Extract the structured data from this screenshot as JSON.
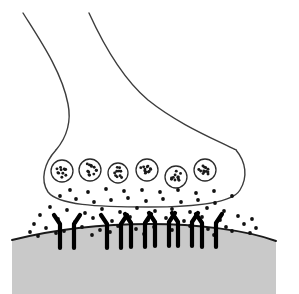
{
  "figure": {
    "width": 299,
    "height": 294,
    "background_color": "#ffffff"
  },
  "style": {
    "outline_color": "#3c3c3c",
    "outline_width": 1.4,
    "vesicle_stroke": "#2b2b2b",
    "vesicle_stroke_width": 1.3,
    "vesicle_fill": "#ffffff",
    "granule_color": "#1a1a1a",
    "receptor_color": "#000000",
    "receptor_width": 4.2,
    "membrane_fill": "#c9c9c9",
    "membrane_stroke": "#1a1a1a",
    "membrane_stroke_width": 2.0,
    "neurotransmitter_color": "#111111",
    "neurotransmitter_radius": 1.9
  },
  "axon": {
    "label": "axon",
    "left_branch_path": "M 23,13 C 40,40 62,72 68,104 C 72,124 66,138 56,150",
    "right_branch_path": "M 89,13 C 104,46 122,78 148,100 C 178,124 212,138 236,150"
  },
  "terminal": {
    "label": "axon-terminal-bouton",
    "outline_path": "M 56,150 C 44,163 40,180 48,192 C 58,205 96,207 148,207 C 198,207 232,203 240,190 C 248,177 246,162 236,150",
    "fill": "#ffffff"
  },
  "vesicles": {
    "label": "synaptic-vesicles",
    "count": 6,
    "items": [
      {
        "id": "vesicle-1",
        "cx": 62,
        "cy": 171,
        "r": 11,
        "granules": 11
      },
      {
        "id": "vesicle-2",
        "cx": 90,
        "cy": 170,
        "r": 11,
        "granules": 12
      },
      {
        "id": "vesicle-3",
        "cx": 118,
        "cy": 173,
        "r": 10,
        "granules": 10
      },
      {
        "id": "vesicle-4",
        "cx": 147,
        "cy": 170,
        "r": 11,
        "granules": 12
      },
      {
        "id": "vesicle-5",
        "cx": 176,
        "cy": 177,
        "r": 11,
        "granules": 11
      },
      {
        "id": "vesicle-6",
        "cx": 205,
        "cy": 170,
        "r": 11,
        "granules": 12
      }
    ]
  },
  "cleft": {
    "label": "synaptic-cleft",
    "neurotransmitter_dots": [
      [
        60,
        196
      ],
      [
        76,
        199
      ],
      [
        94,
        202
      ],
      [
        111,
        200
      ],
      [
        128,
        198
      ],
      [
        146,
        201
      ],
      [
        163,
        199
      ],
      [
        181,
        202
      ],
      [
        198,
        200
      ],
      [
        215,
        203
      ],
      [
        50,
        207
      ],
      [
        67,
        210
      ],
      [
        85,
        213
      ],
      [
        102,
        209
      ],
      [
        120,
        212
      ],
      [
        137,
        208
      ],
      [
        155,
        211
      ],
      [
        172,
        209
      ],
      [
        190,
        212
      ],
      [
        207,
        208
      ],
      [
        224,
        211
      ],
      [
        40,
        215
      ],
      [
        58,
        219
      ],
      [
        75,
        222
      ],
      [
        93,
        218
      ],
      [
        112,
        221
      ],
      [
        130,
        217
      ],
      [
        148,
        220
      ],
      [
        166,
        218
      ],
      [
        184,
        221
      ],
      [
        202,
        217
      ],
      [
        220,
        220
      ],
      [
        238,
        216
      ],
      [
        46,
        228
      ],
      [
        64,
        231
      ],
      [
        82,
        227
      ],
      [
        100,
        230
      ],
      [
        118,
        226
      ],
      [
        136,
        229
      ],
      [
        154,
        227
      ],
      [
        172,
        230
      ],
      [
        190,
        226
      ],
      [
        208,
        229
      ],
      [
        226,
        227
      ],
      [
        244,
        224
      ],
      [
        38,
        236
      ],
      [
        56,
        233
      ],
      [
        92,
        235
      ],
      [
        110,
        232
      ],
      [
        144,
        234
      ],
      [
        178,
        233
      ],
      [
        214,
        235
      ],
      [
        232,
        231
      ],
      [
        250,
        233
      ],
      [
        70,
        190
      ],
      [
        88,
        192
      ],
      [
        106,
        189
      ],
      [
        124,
        191
      ],
      [
        142,
        190
      ],
      [
        160,
        192
      ],
      [
        178,
        190
      ],
      [
        196,
        193
      ],
      [
        214,
        191
      ],
      [
        232,
        196
      ],
      [
        252,
        219
      ],
      [
        256,
        228
      ],
      [
        34,
        224
      ],
      [
        30,
        232
      ]
    ]
  },
  "receptors": {
    "label": "postsynaptic-receptors",
    "count": 6,
    "note": "each receptor rendered as a pair of vertical bars with outward-splayed tops",
    "items": [
      {
        "id": "receptor-1",
        "x_left": 60,
        "x_right": 74,
        "top_y": 215,
        "base_y": 248,
        "splay": 6
      },
      {
        "id": "receptor-2",
        "x_left": 107,
        "x_right": 121,
        "top_y": 215,
        "base_y": 248,
        "splay": 6
      },
      {
        "id": "receptor-3",
        "x_left": 155,
        "x_right": 169,
        "top_y": 213,
        "base_y": 246,
        "splay": 6
      },
      {
        "id": "receptor-4",
        "x_left": 202,
        "x_right": 216,
        "top_y": 214,
        "base_y": 247,
        "splay": 6
      },
      {
        "id": "receptor-5",
        "x_left": 131,
        "x_right": 145,
        "top_y": 214,
        "base_y": 247,
        "splay": 6
      },
      {
        "id": "receptor-6",
        "x_left": 178,
        "x_right": 192,
        "top_y": 213,
        "base_y": 246,
        "splay": 6
      }
    ]
  },
  "postsynaptic_membrane": {
    "label": "postsynaptic-membrane",
    "top_edge_path": "M 12,240 C 60,228 110,224 150,224 C 196,224 246,230 276,241",
    "fill_path": "M 12,240 C 60,228 110,224 150,224 C 196,224 246,230 276,241 L 276,294 L 12,294 Z",
    "fill_color": "#c9c9c9"
  }
}
